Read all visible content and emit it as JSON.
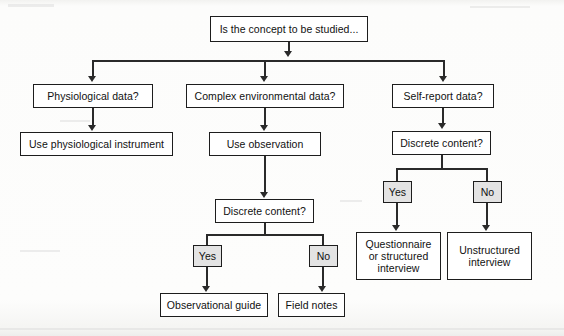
{
  "diagram": {
    "type": "flowchart",
    "style": {
      "box_border_color": "#1d1d1d",
      "box_fill_color": "#ffffff",
      "shaded_box_fill_color": "#e3e3e3",
      "connector_color": "#2a2a2a",
      "background_color": "#fdfdfd"
    },
    "nodes": {
      "root": "Is the concept to be studied...",
      "branch_physiological": "Physiological data?",
      "branch_complex_environmental": "Complex environmental data?",
      "branch_self_report": "Self-report data?",
      "use_physiological_instrument": "Use physiological instrument",
      "use_observation": "Use observation",
      "discrete_content_middle": "Discrete content?",
      "discrete_content_right": "Discrete content?",
      "middle_yes": "Yes",
      "middle_no": "No",
      "right_yes": "Yes",
      "right_no": "No",
      "observational_guide": "Observational guide",
      "field_notes": "Field notes",
      "questionnaire_or_structured_interview": "Questionnaire or structured interview",
      "unstructured_interview": "Unstructured interview"
    },
    "edges": [
      {
        "from": "root",
        "to": "branch_physiological",
        "label": ""
      },
      {
        "from": "root",
        "to": "branch_complex_environmental",
        "label": ""
      },
      {
        "from": "root",
        "to": "branch_self_report",
        "label": ""
      },
      {
        "from": "branch_physiological",
        "to": "use_physiological_instrument",
        "label": ""
      },
      {
        "from": "branch_complex_environmental",
        "to": "use_observation",
        "label": ""
      },
      {
        "from": "use_observation",
        "to": "discrete_content_middle",
        "label": ""
      },
      {
        "from": "discrete_content_middle",
        "to": "middle_yes",
        "label": ""
      },
      {
        "from": "discrete_content_middle",
        "to": "middle_no",
        "label": ""
      },
      {
        "from": "middle_yes",
        "to": "observational_guide",
        "label": ""
      },
      {
        "from": "middle_no",
        "to": "field_notes",
        "label": ""
      },
      {
        "from": "branch_self_report",
        "to": "discrete_content_right",
        "label": ""
      },
      {
        "from": "discrete_content_right",
        "to": "right_yes",
        "label": ""
      },
      {
        "from": "discrete_content_right",
        "to": "right_no",
        "label": ""
      },
      {
        "from": "right_yes",
        "to": "questionnaire_or_structured_interview",
        "label": ""
      },
      {
        "from": "right_no",
        "to": "unstructured_interview",
        "label": ""
      }
    ]
  }
}
